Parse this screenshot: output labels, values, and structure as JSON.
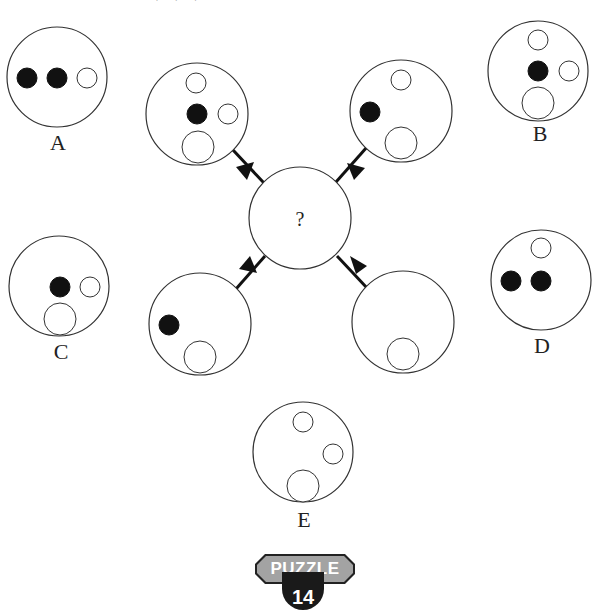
{
  "page": {
    "clipped_heading": "the answer is A, B, C, D or E ?"
  },
  "puzzle": {
    "center": {
      "label": "?"
    },
    "sources": [
      {
        "position": "top-left",
        "dots": [
          "white-top",
          "black-center",
          "white-right",
          "large-white-bottom"
        ]
      },
      {
        "position": "top-right",
        "dots": [
          "white-top",
          "black-left",
          "large-white-bottom"
        ]
      },
      {
        "position": "bottom-left",
        "dots": [
          "black-left",
          "large-white-bottom"
        ]
      },
      {
        "position": "bottom-right",
        "dots": [
          "large-white-bottom"
        ]
      }
    ],
    "options": [
      {
        "label": "A",
        "dots": [
          "black-left",
          "black-center",
          "white-right"
        ]
      },
      {
        "label": "B",
        "dots": [
          "white-top",
          "black-center",
          "white-right",
          "large-white-bottom"
        ]
      },
      {
        "label": "C",
        "dots": [
          "black-center",
          "white-right",
          "large-white-bottom"
        ]
      },
      {
        "label": "D",
        "dots": [
          "white-top",
          "black-left",
          "black-center"
        ]
      },
      {
        "label": "E",
        "dots": [
          "white-top",
          "white-right",
          "large-white-bottom"
        ]
      }
    ]
  },
  "badge": {
    "title": "PUZZLE",
    "number": "14"
  },
  "colors": {
    "stroke": "#333333",
    "fill_black": "#111111",
    "badge_grey": "#a3a3a3",
    "badge_dark": "#1a1a1a"
  }
}
